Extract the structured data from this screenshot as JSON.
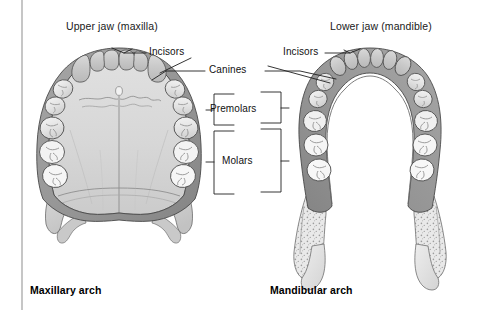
{
  "figure": {
    "title_left": "Upper jaw (maxilla)",
    "title_right": "Lower jaw (mandible)",
    "caption_left": "Maxillary arch",
    "caption_right": "Mandibular arch",
    "background_color": "#ffffff",
    "rule_color": "#c6c6c6"
  },
  "annotations": {
    "incisors_left": "Incisors",
    "incisors_right": "Incisors",
    "canines": "Canines",
    "premolars": "Premolars",
    "molars": "Molars"
  },
  "palette": {
    "tooth_fill": "#efefef",
    "tooth_fill_alt": "#e2e2e2",
    "gum_fill": "#9b9b9b",
    "gum_fill_dark": "#8a8a8a",
    "palate_fill": "#d6d6d6",
    "palate_fill_light": "#dedede",
    "bone_fill": "#d2d2d2",
    "spongy_fill": "#e6e6e6",
    "outline": "#4a4a4a",
    "leader_line": "#1f1f1f",
    "text": "#1a1a1a"
  }
}
